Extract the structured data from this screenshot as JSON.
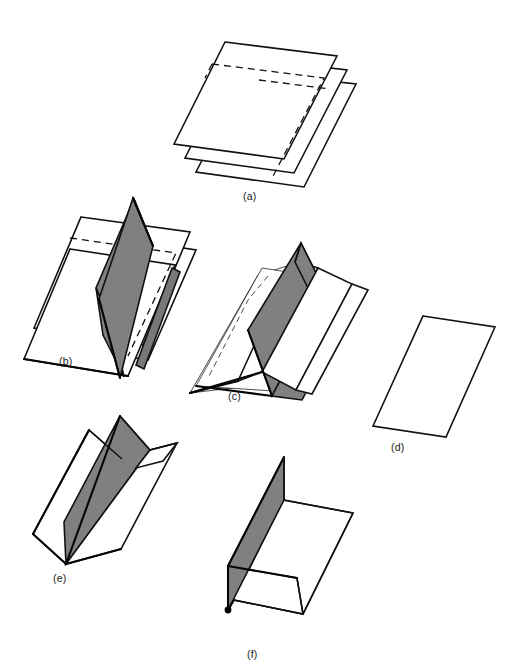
{
  "figure": {
    "kind": "line-diagram",
    "background_color": "#ffffff",
    "line_color": "#111111",
    "shade_color": "#808080",
    "panels": [
      {
        "id": "a",
        "label": "(a)",
        "label_x": 243,
        "label_y": 190,
        "caption_text": "(a)",
        "content": "three stacked flat sheets seen obliquely, hidden edges dashed"
      },
      {
        "id": "b",
        "label": "(b)",
        "label_x": 59,
        "label_y": 355,
        "caption_text": "(b)",
        "content": "stacked sheets cut by a shaded vertical axial plane"
      },
      {
        "id": "c",
        "label": "(c)",
        "label_x": 228,
        "label_y": 390,
        "caption_text": "(c)",
        "content": "stacked sheets beginning to buckle about the shaded axial plane"
      },
      {
        "id": "d",
        "label": "(d)",
        "label_x": 391,
        "label_y": 441,
        "caption_text": "(d)",
        "content": "single undeformed planar sheet"
      },
      {
        "id": "e",
        "label": "(e)",
        "label_x": 53,
        "label_y": 572,
        "caption_text": "(e)",
        "content": "sheet folded into a W / chevron form with shaded limb"
      },
      {
        "id": "f",
        "label": "(f)",
        "label_x": 247,
        "label_y": 648,
        "caption_text": "(f)",
        "content": "sheet folded into an open L / Z form with shaded limb and marked hinge point"
      }
    ],
    "marks": [
      {
        "name": "hinge-point",
        "panel": "f",
        "x": 228,
        "y": 610,
        "radius": 3.4,
        "color": "#000000"
      }
    ]
  }
}
